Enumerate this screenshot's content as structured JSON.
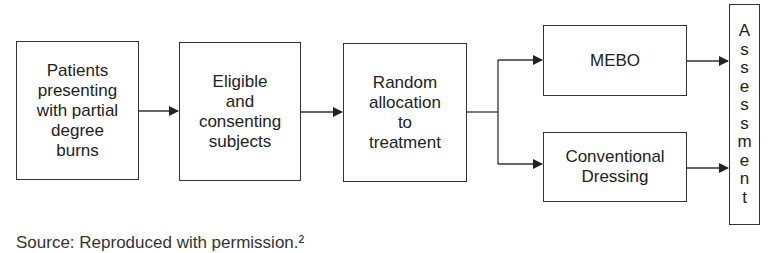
{
  "diagram": {
    "type": "flowchart",
    "nodes": [
      {
        "id": "patients",
        "label": "Patients\npresenting\nwith partial\ndegree\nburns"
      },
      {
        "id": "eligible",
        "label": "Eligible\nand\nconsenting\nsubjects"
      },
      {
        "id": "random",
        "label": "Random\nallocation\nto\ntreatment"
      },
      {
        "id": "mebo",
        "label": "MEBO"
      },
      {
        "id": "conventional",
        "label": "Conventional\nDressing"
      },
      {
        "id": "assessment",
        "label": "Assessment",
        "letters": [
          "A",
          "s",
          "s",
          "e",
          "s",
          "s",
          "m",
          "e",
          "n",
          "t"
        ]
      }
    ],
    "edges": [
      {
        "from": "patients",
        "to": "eligible"
      },
      {
        "from": "eligible",
        "to": "random"
      },
      {
        "from": "random",
        "to": "mebo"
      },
      {
        "from": "random",
        "to": "conventional"
      },
      {
        "from": "mebo",
        "to": "assessment"
      },
      {
        "from": "conventional",
        "to": "assessment"
      }
    ],
    "colors": {
      "stroke": "#333333",
      "background": "#ffffff",
      "text": "#222222"
    }
  },
  "caption": {
    "text": "Source: Reproduced with permission.²"
  }
}
